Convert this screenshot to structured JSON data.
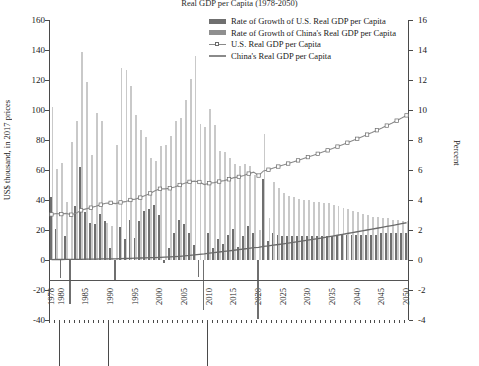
{
  "title": "Real GDP per Capita (1978-2050)",
  "axes": {
    "left_title": "US$ thousand, in 2017 prices",
    "right_title": "Percent",
    "left_ticks": [
      160,
      140,
      120,
      100,
      80,
      60,
      40,
      20,
      0,
      -20,
      -40
    ],
    "right_ticks": [
      16,
      14,
      12,
      10,
      8,
      6,
      4,
      2,
      0,
      -2,
      -4
    ],
    "left_min": -40,
    "left_max": 160,
    "right_min": -4,
    "right_max": 16,
    "x_min": 1978,
    "x_max": 2050,
    "x_labels": [
      1978,
      1980,
      1985,
      1990,
      1995,
      2000,
      2005,
      2010,
      2015,
      2020,
      2025,
      2030,
      2035,
      2040,
      2045,
      2050
    ]
  },
  "legend": {
    "position": "top-center",
    "items": [
      {
        "label": "Rate of Growth of U.S. Real GDP per Capita",
        "type": "bar",
        "color": "#6f6f6f"
      },
      {
        "label": "Rate of Growth of China's Real GDP per Capita",
        "type": "bar",
        "color": "#8f8f8f"
      },
      {
        "label": "U.S. Real GDP per Capita",
        "type": "line-marker",
        "color": "#8a8a8a"
      },
      {
        "label": "China's Real GDP per Capita",
        "type": "line",
        "color": "#8a8a8a"
      }
    ]
  },
  "chart_data": {
    "type": "bar",
    "title": "Real GDP per Capita (1978-2050)",
    "xlabel": "",
    "ylabel": "US$ thousand, in 2017 prices",
    "ylabel_right": "Percent",
    "ylim": [
      -40,
      160
    ],
    "ylim_right": [
      -4,
      16
    ],
    "grid": false,
    "legend_position": "top-center",
    "x": [
      1978,
      1979,
      1980,
      1981,
      1982,
      1983,
      1984,
      1985,
      1986,
      1987,
      1988,
      1989,
      1990,
      1991,
      1992,
      1993,
      1994,
      1995,
      1996,
      1997,
      1998,
      1999,
      2000,
      2001,
      2002,
      2003,
      2004,
      2005,
      2006,
      2007,
      2008,
      2009,
      2010,
      2011,
      2012,
      2013,
      2014,
      2015,
      2016,
      2017,
      2018,
      2019,
      2020,
      2021,
      2022,
      2023,
      2024,
      2025,
      2026,
      2027,
      2028,
      2029,
      2030,
      2031,
      2032,
      2033,
      2034,
      2035,
      2036,
      2037,
      2038,
      2039,
      2040,
      2041,
      2042,
      2043,
      2044,
      2045,
      2046,
      2047,
      2048,
      2049,
      2050
    ],
    "series": [
      {
        "name": "Rate of Growth of U.S. Real GDP per Capita",
        "axis": "right",
        "unit": "percent",
        "type": "bar",
        "color": "#6f6f6f",
        "values": [
          4.2,
          2.1,
          -1.2,
          1.6,
          -2.9,
          3.6,
          6.2,
          3.2,
          2.5,
          2.4,
          3.1,
          2.6,
          0.8,
          -1.4,
          2.2,
          1.4,
          2.7,
          1.5,
          2.6,
          3.3,
          3.4,
          3.7,
          3.0,
          -0.2,
          0.8,
          1.8,
          2.7,
          2.4,
          1.8,
          1.0,
          -1.1,
          -3.3,
          1.8,
          0.8,
          1.4,
          1.1,
          1.7,
          2.1,
          0.9,
          1.6,
          2.3,
          1.8,
          -3.9,
          5.4,
          1.3,
          1.8,
          1.7,
          1.6,
          1.6,
          1.6,
          1.6,
          1.6,
          1.6,
          1.6,
          1.6,
          1.6,
          1.6,
          1.6,
          1.7,
          1.7,
          1.7,
          1.7,
          1.7,
          1.7,
          1.7,
          1.7,
          1.7,
          1.8,
          1.8,
          1.8,
          1.8,
          1.8,
          1.8
        ]
      },
      {
        "name": "Rate of Growth of China's Real GDP per Capita",
        "axis": "right",
        "unit": "percent",
        "type": "bar",
        "color": "#c9c9c9",
        "values": [
          10.2,
          6.1,
          6.5,
          3.9,
          7.9,
          9.3,
          13.9,
          11.9,
          7.0,
          9.8,
          9.3,
          2.5,
          2.3,
          7.7,
          12.8,
          12.7,
          11.6,
          9.7,
          8.7,
          8.2,
          6.8,
          6.6,
          7.6,
          7.7,
          8.3,
          9.3,
          9.5,
          10.7,
          12.1,
          13.6,
          9.1,
          8.9,
          10.1,
          9.0,
          7.3,
          7.2,
          6.8,
          6.4,
          6.3,
          6.4,
          6.3,
          5.7,
          2.0,
          8.4,
          2.8,
          5.2,
          4.8,
          4.5,
          4.3,
          4.2,
          4.1,
          4.0,
          4.0,
          3.9,
          3.9,
          3.8,
          3.8,
          3.7,
          3.6,
          3.5,
          3.4,
          3.3,
          3.2,
          3.1,
          3.0,
          2.9,
          2.9,
          2.8,
          2.8,
          2.7,
          2.7,
          2.6,
          2.6
        ]
      },
      {
        "name": "U.S. Real GDP per Capita",
        "axis": "left",
        "unit": "US$ thousand",
        "type": "line",
        "marker": "open-square",
        "color": "#8a8a8a",
        "values": [
          30.4,
          31.0,
          30.6,
          31.1,
          30.2,
          31.2,
          33.1,
          34.1,
          34.9,
          35.8,
          36.9,
          37.8,
          38.1,
          37.6,
          38.4,
          38.9,
          40.0,
          40.6,
          41.6,
          43.0,
          44.4,
          46.1,
          47.5,
          47.4,
          47.8,
          48.6,
          50.0,
          51.2,
          52.1,
          52.6,
          52.0,
          50.3,
          51.2,
          51.6,
          52.3,
          52.9,
          53.8,
          54.9,
          55.4,
          56.3,
          57.6,
          58.6,
          56.3,
          59.4,
          60.2,
          61.3,
          62.3,
          63.3,
          64.3,
          65.4,
          66.4,
          67.5,
          68.6,
          69.7,
          70.8,
          72.0,
          73.1,
          74.3,
          75.6,
          76.9,
          78.2,
          79.5,
          80.8,
          82.2,
          83.6,
          85.0,
          86.5,
          88.0,
          89.6,
          91.2,
          92.9,
          94.6,
          96.4
        ]
      },
      {
        "name": "China's Real GDP per Capita",
        "axis": "left",
        "unit": "US$ thousand",
        "type": "line",
        "color": "#6a6a6a",
        "values": [
          0.3,
          0.32,
          0.34,
          0.36,
          0.39,
          0.42,
          0.48,
          0.54,
          0.58,
          0.63,
          0.69,
          0.71,
          0.73,
          0.78,
          0.88,
          1.0,
          1.11,
          1.22,
          1.33,
          1.44,
          1.53,
          1.64,
          1.76,
          1.9,
          2.06,
          2.25,
          2.46,
          2.73,
          3.06,
          3.47,
          3.79,
          4.13,
          4.55,
          4.96,
          5.32,
          5.71,
          6.1,
          6.49,
          6.9,
          7.34,
          7.8,
          8.25,
          8.41,
          9.12,
          9.37,
          9.86,
          10.33,
          10.79,
          11.26,
          11.73,
          12.21,
          12.7,
          13.21,
          13.72,
          14.26,
          14.8,
          15.36,
          15.93,
          16.5,
          17.08,
          17.66,
          18.24,
          18.83,
          19.41,
          19.99,
          20.57,
          21.17,
          21.76,
          22.37,
          22.97,
          23.59,
          24.2,
          24.83
        ]
      }
    ]
  }
}
